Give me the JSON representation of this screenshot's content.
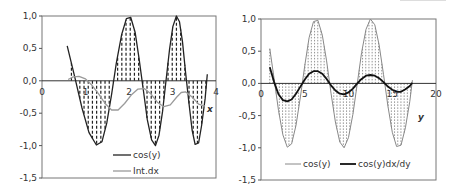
{
  "chart_data": [
    {
      "type": "line",
      "title": "",
      "xlabel": "x",
      "ylabel": "",
      "xlim": [
        0,
        4
      ],
      "ylim": [
        -1.5,
        1.0
      ],
      "x_ticks": [
        "0",
        "1",
        "2",
        "3",
        "4"
      ],
      "y_ticks": [
        "1,0",
        "0,5",
        "0,0",
        "-0,5",
        "-1,0",
        "-1,5"
      ],
      "grid": false,
      "legend_position": "bottom-inside",
      "hatched_area": "cos(y) filled to zero with dashed vertical lines",
      "series": [
        {
          "name": "cos(y)",
          "color": "#222222",
          "x": [
            0.58,
            0.75,
            0.92,
            1.08,
            1.25,
            1.38,
            1.49,
            1.6,
            1.71,
            1.83,
            1.94,
            2.04,
            2.14,
            2.23,
            2.33,
            2.42,
            2.52,
            2.61,
            2.69,
            2.77,
            2.85,
            2.93,
            3.01,
            3.09,
            3.16,
            3.23,
            3.3,
            3.38,
            3.45,
            3.52,
            3.6,
            3.67,
            3.75,
            3.8
          ],
          "values": [
            0.54,
            0.07,
            -0.42,
            -0.8,
            -0.99,
            -0.94,
            -0.65,
            -0.21,
            0.28,
            0.71,
            0.96,
            0.98,
            0.75,
            0.35,
            -0.15,
            -0.6,
            -0.91,
            -1.0,
            -0.84,
            -0.48,
            0.0,
            0.48,
            0.84,
            1.0,
            0.91,
            0.6,
            0.14,
            -0.35,
            -0.76,
            -0.98,
            -0.96,
            -0.69,
            -0.28,
            0.1
          ]
        },
        {
          "name": "Int.dx",
          "color": "#9a9a9a",
          "x": [
            0.6,
            0.72,
            0.85,
            1.0,
            1.15,
            1.3,
            1.45,
            1.6,
            1.75,
            1.9,
            2.05,
            2.2,
            2.35,
            2.5,
            2.65,
            2.8,
            2.95,
            3.1,
            3.2,
            3.3,
            3.45,
            3.6,
            3.75
          ],
          "values": [
            0.02,
            0.06,
            0.07,
            0.03,
            -0.07,
            -0.2,
            -0.35,
            -0.45,
            -0.45,
            -0.35,
            -0.22,
            -0.13,
            -0.12,
            -0.2,
            -0.33,
            -0.4,
            -0.37,
            -0.25,
            -0.18,
            -0.17,
            -0.25,
            -0.36,
            -0.39
          ]
        }
      ]
    },
    {
      "type": "line",
      "title": "",
      "xlabel": "y",
      "ylabel": "",
      "xlim": [
        0,
        20
      ],
      "ylim": [
        -1.5,
        1.0
      ],
      "x_ticks": [
        "0",
        "5",
        "10",
        "15",
        "20"
      ],
      "y_ticks": [
        "1,0",
        "0,5",
        "0,0",
        "-0,5",
        "-1,0",
        "-1,5"
      ],
      "grid": false,
      "legend_position": "bottom-inside",
      "hatched_area": "cos(y) filled to zero with dotted vertical lines",
      "series": [
        {
          "name": "cos(y)",
          "color": "#888888",
          "x": [
            1,
            1.5,
            2,
            2.5,
            3,
            3.5,
            4,
            4.5,
            5,
            5.5,
            6,
            6.5,
            7,
            7.5,
            8,
            8.5,
            9,
            9.5,
            10,
            10.5,
            11,
            11.5,
            12,
            12.5,
            13,
            13.5,
            14,
            14.5,
            15,
            15.5,
            16,
            16.5,
            17,
            17.3
          ],
          "values": [
            0.54,
            0.07,
            -0.42,
            -0.8,
            -0.99,
            -0.94,
            -0.65,
            -0.21,
            0.28,
            0.71,
            0.96,
            0.98,
            0.75,
            0.35,
            -0.15,
            -0.6,
            -0.91,
            -1.0,
            -0.84,
            -0.48,
            0.0,
            0.48,
            0.84,
            1.0,
            0.91,
            0.6,
            0.14,
            -0.35,
            -0.76,
            -0.98,
            -0.96,
            -0.69,
            -0.28,
            0.05
          ]
        },
        {
          "name": "cos(y)dx/dy",
          "color": "#111111",
          "x": [
            1,
            1.5,
            2,
            2.5,
            3,
            3.5,
            4,
            4.5,
            5,
            5.5,
            6,
            6.5,
            7,
            7.5,
            8,
            8.5,
            9,
            9.5,
            10,
            10.5,
            11,
            11.5,
            12,
            12.5,
            13,
            13.5,
            14,
            14.5,
            15,
            15.5,
            16,
            16.5,
            17,
            17.3
          ],
          "values": [
            0.25,
            0.02,
            -0.17,
            -0.26,
            -0.28,
            -0.25,
            -0.16,
            -0.05,
            0.06,
            0.15,
            0.19,
            0.19,
            0.15,
            0.07,
            -0.03,
            -0.11,
            -0.16,
            -0.17,
            -0.14,
            -0.08,
            0.0,
            0.07,
            0.12,
            0.13,
            0.12,
            0.08,
            0.02,
            -0.05,
            -0.1,
            -0.13,
            -0.13,
            -0.09,
            -0.04,
            0.01
          ]
        }
      ]
    }
  ]
}
